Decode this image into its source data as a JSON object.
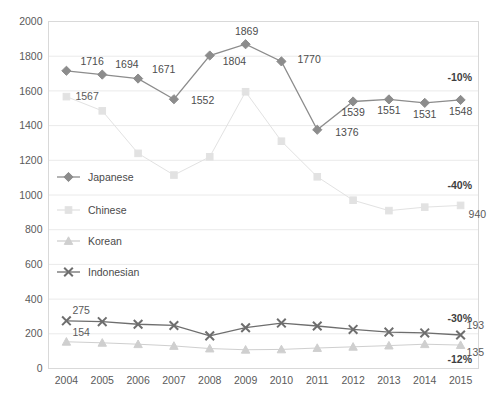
{
  "chart_data": {
    "type": "line",
    "title": "",
    "subtitle": "",
    "xlabel": "",
    "ylabel": "",
    "categories": [
      "2004",
      "2005",
      "2006",
      "2007",
      "2008",
      "2009",
      "2010",
      "2011",
      "2012",
      "2013",
      "2014",
      "2015"
    ],
    "ylim": [
      0,
      2000
    ],
    "y_ticks": [
      0,
      200,
      400,
      600,
      800,
      1000,
      1200,
      1400,
      1600,
      1800,
      2000
    ],
    "grid": true,
    "legend_position": "inside-left",
    "series": [
      {
        "name": "Japanese",
        "marker": "diamond",
        "color": "#8c8c8c",
        "values": [
          1716,
          1694,
          1671,
          1552,
          1804,
          1869,
          1770,
          1376,
          1539,
          1551,
          1531,
          1548
        ],
        "data_labels": [
          "1716",
          "1694",
          "1671",
          "1552",
          "1804",
          "1869",
          "1770",
          "1376",
          "1539",
          "1551",
          "1531",
          "1548"
        ],
        "change_label": "-10%"
      },
      {
        "name": "Chinese",
        "marker": "square",
        "color": "#e2e2e2",
        "values": [
          1567,
          1485,
          1240,
          1115,
          1220,
          1595,
          1310,
          1105,
          970,
          910,
          930,
          940
        ],
        "data_labels": [
          "1567",
          "",
          "",
          "",
          "",
          "",
          "",
          "",
          "",
          "",
          "",
          "940"
        ],
        "change_label": "-40%"
      },
      {
        "name": "Korean",
        "marker": "triangle",
        "color": "#cfcfcf",
        "values": [
          154,
          148,
          140,
          130,
          115,
          108,
          110,
          118,
          125,
          132,
          140,
          135
        ],
        "data_labels": [
          "154",
          "",
          "",
          "",
          "",
          "",
          "",
          "",
          "",
          "",
          "",
          "135"
        ],
        "change_label": "-12%"
      },
      {
        "name": "Indonesian",
        "marker": "x",
        "color": "#6e6e6e",
        "values": [
          275,
          270,
          255,
          248,
          188,
          235,
          262,
          245,
          225,
          210,
          205,
          193
        ],
        "data_labels": [
          "275",
          "",
          "",
          "",
          "",
          "",
          "",
          "",
          "",
          "",
          "",
          "193"
        ],
        "change_label": "-30%"
      }
    ],
    "axis_tick_labels": {
      "y": [
        "2000",
        "1800",
        "1600",
        "1400",
        "1200",
        "1000",
        "800",
        "600",
        "400",
        "200",
        "0"
      ],
      "x": [
        "2004",
        "2005",
        "2006",
        "2007",
        "2008",
        "2009",
        "2010",
        "2011",
        "2012",
        "2013",
        "2014",
        "2015"
      ]
    },
    "legend_entries": [
      {
        "label": "Japanese",
        "marker": "diamond",
        "color": "#8c8c8c"
      },
      {
        "label": "Chinese",
        "marker": "square",
        "color": "#e2e2e2"
      },
      {
        "label": "Korean",
        "marker": "triangle",
        "color": "#cfcfcf"
      },
      {
        "label": "Indonesian",
        "marker": "x",
        "color": "#6e6e6e"
      }
    ],
    "percent_labels": [
      {
        "series": "Japanese",
        "text": "-10%"
      },
      {
        "series": "Chinese",
        "text": "-40%"
      },
      {
        "series": "Indonesian",
        "text": "-30%"
      },
      {
        "series": "Korean",
        "text": "-12%"
      }
    ]
  }
}
